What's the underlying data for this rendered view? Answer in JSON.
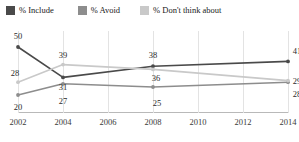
{
  "legend": {
    "items": [
      {
        "label": "% Include",
        "color": "#4a4a4a",
        "key": "include"
      },
      {
        "label": "% Avoid",
        "color": "#8d8d8d",
        "key": "avoid"
      },
      {
        "label": "% Don't think about",
        "color": "#c9c9c9",
        "key": "dont_think"
      }
    ]
  },
  "chart_data": {
    "type": "line",
    "title": "",
    "subtitle": "",
    "xlabel": "",
    "ylabel": "",
    "x": [
      2002,
      2004,
      2008,
      2014
    ],
    "categories": [
      "2002",
      "2004",
      "2008",
      "2014"
    ],
    "xlim": [
      2002,
      2014
    ],
    "ylim": [
      15,
      55
    ],
    "grid": "vertical",
    "legend_position": "top-left",
    "axis_ticks": [
      "2002",
      "2004",
      "2006",
      "2008",
      "2010",
      "2012",
      "2014"
    ],
    "series": [
      {
        "name": "% Include",
        "color": "#4a4a4a",
        "values": [
          50,
          31,
          38,
          41
        ],
        "labels": [
          "50",
          "31",
          "38",
          "41"
        ]
      },
      {
        "name": "% Avoid",
        "color": "#8d8d8d",
        "values": [
          20,
          27,
          25,
          28
        ],
        "labels": [
          "20",
          "27",
          "25",
          "28"
        ]
      },
      {
        "name": "% Don't think about",
        "color": "#c9c9c9",
        "values": [
          28,
          39,
          36,
          29
        ],
        "labels": [
          "28",
          "39",
          "36",
          "29"
        ]
      }
    ]
  },
  "labels": {
    "include_2002": "50",
    "include_2004": "31",
    "include_2008": "38",
    "include_2014": "41",
    "avoid_2002": "20",
    "avoid_2004": "27",
    "avoid_2008": "25",
    "avoid_2014": "28",
    "dont_2002": "28",
    "dont_2004": "39",
    "dont_2008": "36",
    "dont_2014": "29"
  },
  "xaxis": {
    "ticks": [
      "2002",
      "2004",
      "2006",
      "2008",
      "2010",
      "2012",
      "2014"
    ]
  }
}
